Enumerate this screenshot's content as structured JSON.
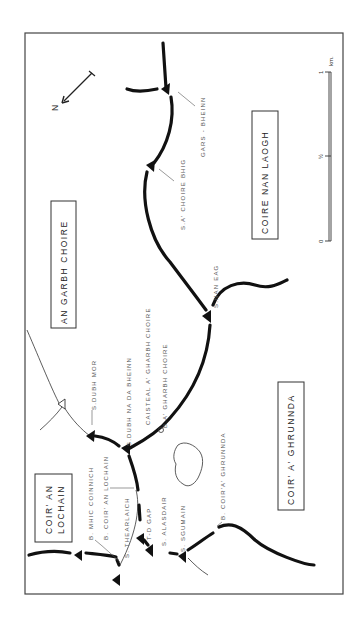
{
  "map": {
    "subject": "Sketch map of the southern Cuillin ridge, Skye (rotated)",
    "orientation": "rotated 90 degrees counter-clockwise",
    "north_label": "N",
    "areas": [
      {
        "id": "an-garbh-choire",
        "label": "AN GARBH CHOIRE"
      },
      {
        "id": "coire-nan-laogh",
        "label": "COIRE NAN LAOGH"
      },
      {
        "id": "coir-a-ghrunnda",
        "label": "COIR' A' GHRUNNDA"
      },
      {
        "id": "coir-an-lochain",
        "line1": "COIR' AN",
        "line2": "LOCHAIN"
      }
    ],
    "features": [
      {
        "id": "gars-bheinn",
        "label": "GARS - BHEINN"
      },
      {
        "id": "sgurr-a-choire-bhig",
        "label": "S.A' CHOIRE BHIG"
      },
      {
        "id": "sgurr-nan-eag",
        "label": "S.NAN EAG"
      },
      {
        "id": "sgurr-dubh-mor",
        "label": "S.DUBH MOR"
      },
      {
        "id": "sgurr-dubh-na-da-bheinn",
        "label": "S.DUBH NA DA BHEINN"
      },
      {
        "id": "caisteal-a-gharbh-choire",
        "label": "CAISTEAL A' GHARBH CHOIRE"
      },
      {
        "id": "bealach-a-gharbh-choire",
        "label": "B.A' GHARBH CHOIRE"
      },
      {
        "id": "bealach-coir-a-ghrunnda",
        "label": "B. COIR'A' GHRUNNDA"
      },
      {
        "id": "bealach-mhic-coinnich",
        "label": "B. MHIC COINNICH"
      },
      {
        "id": "bealach-coir-an-lochain",
        "label": "B. COIR' AN LOCHAIN"
      },
      {
        "id": "sgurr-thearlaich",
        "label": "S. THEARLAICH"
      },
      {
        "id": "td-gap",
        "label": "T-D GAP"
      },
      {
        "id": "sgurr-alasdair",
        "label": "S. ALASDAIR"
      },
      {
        "id": "sgurr-sgumain",
        "label": "S. SGUMAIN"
      }
    ],
    "scale_bar": {
      "unit": "km.",
      "ticks": [
        "0",
        "½",
        "1"
      ]
    }
  }
}
